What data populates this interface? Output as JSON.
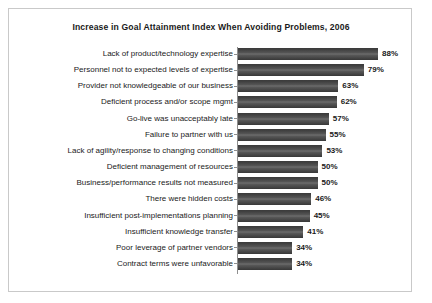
{
  "frame": {
    "border_color": "#c9c9c9",
    "background": "#ffffff"
  },
  "chart_data": {
    "type": "bar",
    "orientation": "horizontal",
    "title": "Increase in Goal Attainment Index When Avoiding Problems, 2006",
    "xlabel": "",
    "ylabel": "",
    "xlim": [
      0,
      100
    ],
    "grid": false,
    "legend": null,
    "value_suffix": "%",
    "bar_color": "#3d3d3d",
    "categories": [
      "Lack of product/technology expertise",
      "Personnel not to expected levels of expertise",
      "Provider not knowledgeable of our business",
      "Deficient process and/or scope mgmt",
      "Go-live was unacceptably late",
      "Failure to partner with us",
      "Lack of agility/response to changing conditions",
      "Deficient management of resources",
      "Business/performance results not measured",
      "There were hidden costs",
      "Insufficient post-implementations planning",
      "Insufficient knowledge transfer",
      "Poor leverage of partner vendors",
      "Contract terms were unfavorable"
    ],
    "values": [
      88,
      79,
      63,
      62,
      57,
      55,
      53,
      50,
      50,
      46,
      45,
      41,
      34,
      34
    ],
    "value_labels": [
      "88%",
      "79%",
      "63%",
      "62%",
      "57%",
      "55%",
      "53%",
      "50%",
      "50%",
      "46%",
      "45%",
      "41%",
      "34%",
      "34%"
    ]
  }
}
